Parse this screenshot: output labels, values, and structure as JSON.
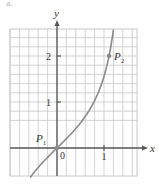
{
  "figure": {
    "panel_label": "a.",
    "x_axis_label": "x",
    "y_axis_label": "y",
    "origin_label": "0"
  },
  "chart_data": {
    "type": "line",
    "title": "",
    "xlabel": "x",
    "ylabel": "y",
    "function": "y = tan x",
    "xlim": [
      -1.0,
      1.7
    ],
    "ylim": [
      -0.6,
      2.55
    ],
    "grid": true,
    "grid_step": 0.2,
    "x_ticks": [
      {
        "value": 1,
        "label": "1"
      }
    ],
    "y_ticks": [
      {
        "value": 1,
        "label": "1"
      },
      {
        "value": 2,
        "label": "2"
      }
    ],
    "series": [
      {
        "name": "curve",
        "color": "#8a8a8a",
        "x": [
          -0.5,
          -0.4,
          -0.2,
          0,
          0.2,
          0.4,
          0.6,
          0.8,
          1.0,
          1.107,
          1.2
        ],
        "y": [
          -0.546,
          -0.423,
          -0.203,
          0,
          0.203,
          0.423,
          0.684,
          1.03,
          1.557,
          2.0,
          2.572
        ]
      }
    ],
    "points": [
      {
        "name": "P1",
        "label": "P",
        "sub": "1",
        "x": 0,
        "y": 0
      },
      {
        "name": "P2",
        "label": "P",
        "sub": "2",
        "x": 1.107,
        "y": 2
      }
    ]
  },
  "colors": {
    "grid": "#c8c8c8",
    "axis": "#555555",
    "curve": "#8a8a8a",
    "text": "#333333"
  }
}
